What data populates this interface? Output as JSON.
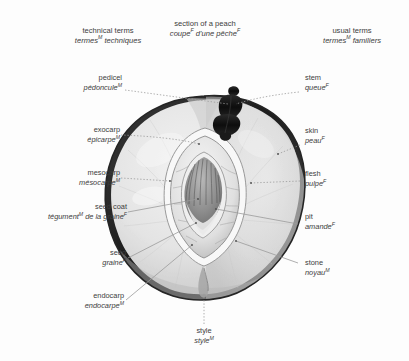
{
  "headings": {
    "left": {
      "en": "technical terms",
      "fr": "termes",
      "fr_sup": "M",
      "fr_rest": " techniques"
    },
    "center": {
      "en": "section of a peach",
      "fr": "coupe",
      "fr_sup": "F",
      "fr_rest": " d'une pêche",
      "fr_sup2": "F"
    },
    "right": {
      "en": "usual terms",
      "fr": "termes",
      "fr_sup": "M",
      "fr_rest": " familiers"
    }
  },
  "labels": {
    "pedicel": {
      "en": "pedicel",
      "fr": "pédoncule",
      "sup": "M"
    },
    "exocarp": {
      "en": "exocarp",
      "fr": "épicarpe",
      "sup": "M"
    },
    "mesocarp": {
      "en": "mesocarp",
      "fr": "mésocarpe",
      "sup": "M"
    },
    "seed_coat": {
      "en": "seed coat",
      "fr": "tégument",
      "sup": "M",
      "fr_rest": " de la graine",
      "sup2": "F"
    },
    "seed": {
      "en": "seed",
      "fr": "graine",
      "sup": "F"
    },
    "endocarp": {
      "en": "endocarp",
      "fr": "endocarpe",
      "sup": "M"
    },
    "style": {
      "en": "style",
      "fr": "style",
      "sup": "M"
    },
    "stem": {
      "en": "stem",
      "fr": "queue",
      "sup": "F"
    },
    "skin": {
      "en": "skin",
      "fr": "peau",
      "sup": "F"
    },
    "flesh": {
      "en": "flesh",
      "fr": "pulpe",
      "sup": "F"
    },
    "pit": {
      "en": "pit",
      "fr": "amande",
      "sup": "F"
    },
    "stone": {
      "en": "stone",
      "fr": "noyau",
      "sup": "M"
    }
  },
  "colors": {
    "background": "#fdfdfd",
    "text": "#3c3c3c",
    "leader_line": "#8f8f8f",
    "skin_outline": "#2b2b2b",
    "flesh_light": "#ededed",
    "flesh_mid": "#d9d9d9",
    "flesh_shadow": "#bfbfbf",
    "stone_dark": "#6e6e6e",
    "seed_dark": "#575757",
    "stem_dark": "#151515"
  },
  "figure": {
    "view": "longitudinal section",
    "parts": [
      "stem",
      "skin / exocarp",
      "flesh / mesocarp",
      "stone / endocarp",
      "seed",
      "seed coat",
      "style"
    ]
  }
}
